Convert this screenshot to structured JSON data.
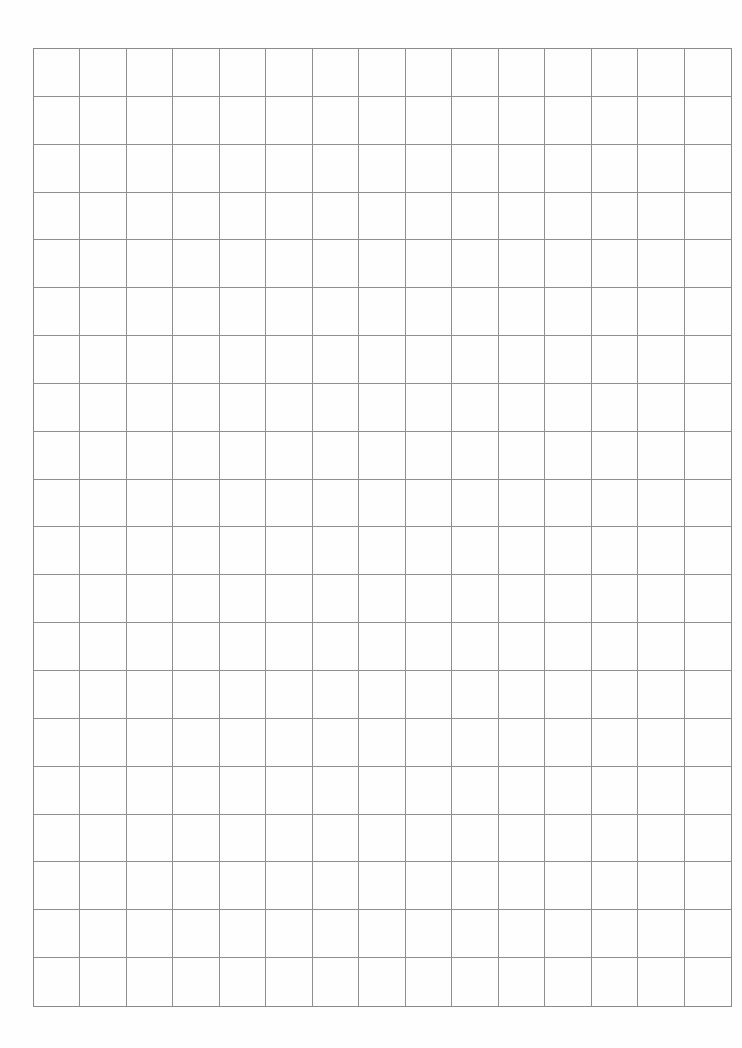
{
  "page": {
    "type": "graph-paper",
    "background_color": "#ffffff",
    "line_color": "#8f8f8f"
  },
  "grid": {
    "columns": 15,
    "rows": 20,
    "cells": []
  }
}
